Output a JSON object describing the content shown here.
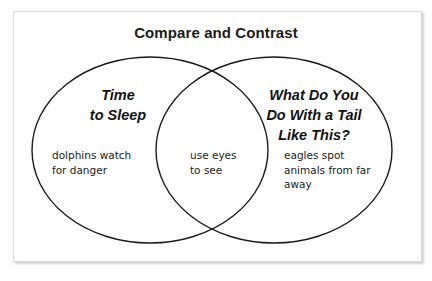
{
  "diagram": {
    "type": "venn",
    "title": "Compare and Contrast",
    "left": {
      "heading_lines": [
        "Time",
        "to Sleep"
      ],
      "body_lines": [
        "dolphins watch",
        "for danger"
      ]
    },
    "overlap": {
      "body_lines": [
        "use eyes",
        "to see"
      ]
    },
    "right": {
      "heading_lines": [
        "What Do You",
        "Do With a Tail",
        "Like This?"
      ],
      "body_lines": [
        "eagles spot",
        "animals from far",
        "away"
      ]
    },
    "colors": {
      "stroke": "#1a1a1a",
      "background": "#ffffff",
      "frame_border": "#d9d9d9"
    }
  }
}
